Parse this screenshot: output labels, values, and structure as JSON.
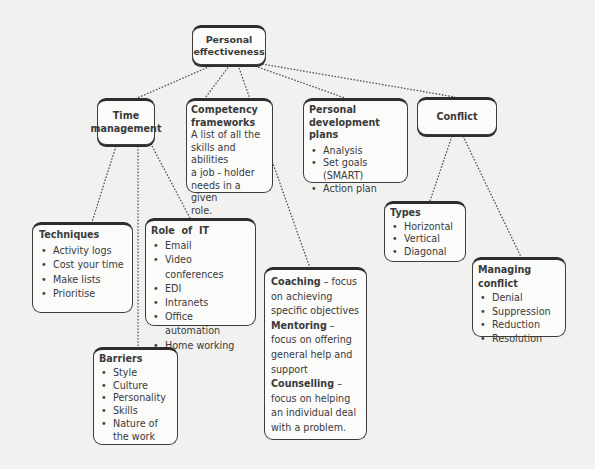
{
  "diagram": {
    "root": {
      "label_line1": "Personal",
      "label_line2": "effectiveness"
    },
    "time_management": {
      "label_line1": "Time",
      "label_line2": "management"
    },
    "competency": {
      "title_line1": "Competency",
      "title_line2": "frameworks",
      "text_lines": [
        "A list of all the",
        "skills and abilities",
        "a job - holder",
        "needs in a given",
        "role."
      ]
    },
    "pdp": {
      "title_line1": "Personal",
      "title_line2": "development plans",
      "items": [
        "Analysis",
        "Set goals (SMART)",
        "Action plan"
      ]
    },
    "conflict": {
      "label": "Conflict"
    },
    "techniques": {
      "title": "Techniques",
      "items": [
        "Activity logs",
        "Cost your time",
        "Make lists",
        "Prioritise"
      ]
    },
    "role_of_it": {
      "title": "Role  of  IT",
      "items": [
        "Email",
        "Video conferences",
        "EDI",
        "Intranets",
        "Office automation",
        "Home working"
      ]
    },
    "barriers": {
      "title": "Barriers",
      "items": [
        "Style",
        "Culture",
        "Personality",
        "Skills",
        "Nature of the work"
      ]
    },
    "coaching": {
      "coaching_term": "Coaching",
      "coaching_desc": " – focus on achieving specific objectives",
      "mentoring_term": "Mentoring",
      "mentoring_desc": " – focus on offering general help and support",
      "counselling_term": "Counselling",
      "counselling_desc": " – focus on helping an individual deal with a problem."
    },
    "types": {
      "title": "Types",
      "items": [
        "Horizontal",
        "Vertical",
        "Diagonal"
      ]
    },
    "managing_conflict": {
      "title": "Managing conflict",
      "items": [
        "Denial",
        "Suppression",
        "Reduction",
        "Resolution"
      ]
    },
    "colors": {
      "border": "#3d3d3d",
      "box_fill": "#fbfbfa",
      "background": "#f1f1ef",
      "line": "#555555"
    }
  }
}
